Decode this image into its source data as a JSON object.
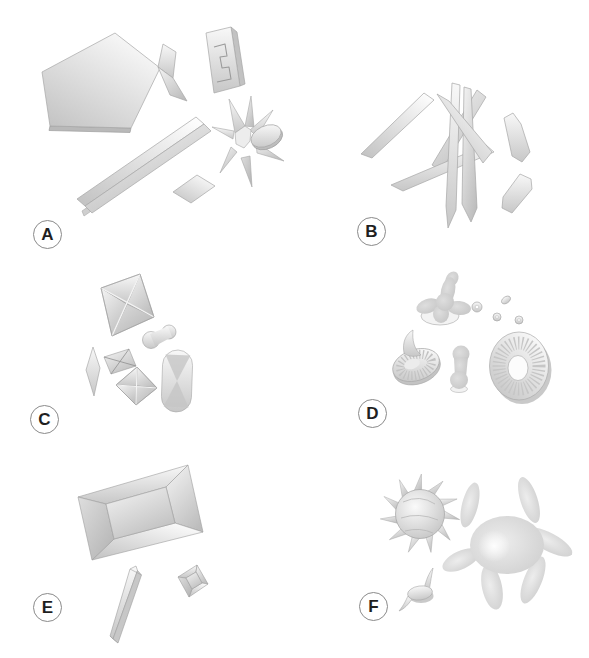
{
  "figure": {
    "type": "six-panel crystal morphology illustration",
    "background": "#ffffff"
  },
  "panels": [
    {
      "label": "A",
      "shapes": [
        "pentagonal-plate",
        "bent-plate",
        "notched-plate",
        "long-lath-plate",
        "rhombic-plate",
        "star-rosette",
        "oval-crystal"
      ]
    },
    {
      "label": "B",
      "shapes": [
        "crossed-lath-cluster",
        "hexagonal-lath",
        "small-pointed-lath"
      ]
    },
    {
      "label": "C",
      "shapes": [
        "large-envelope-octahedron",
        "dumbbell",
        "lens-crystal",
        "small-envelope",
        "medium-envelope",
        "hourglass-capsule"
      ]
    },
    {
      "label": "D",
      "shapes": [
        "lobed-cross-mass",
        "granule-rings",
        "striated-disc-with-spicule",
        "dumbbell",
        "striated-torus-disc"
      ]
    },
    {
      "label": "E",
      "shapes": [
        "large-coffin-lid-prism",
        "narrow-prism",
        "small-coffin-lid-prism"
      ]
    },
    {
      "label": "F",
      "shapes": [
        "thorn-apple-sphere",
        "lobed-amoeboid-mass",
        "small-spiked-disc"
      ]
    }
  ],
  "colors": {
    "background": "#ffffff",
    "crystal_light": "#fbfbfb",
    "crystal_mid": "#d9d9d9",
    "crystal_dark": "#b9b9b9",
    "outline": "#a6a6a6",
    "label_ring": "#8a8a8a",
    "label_text": "#1f1f1f"
  }
}
